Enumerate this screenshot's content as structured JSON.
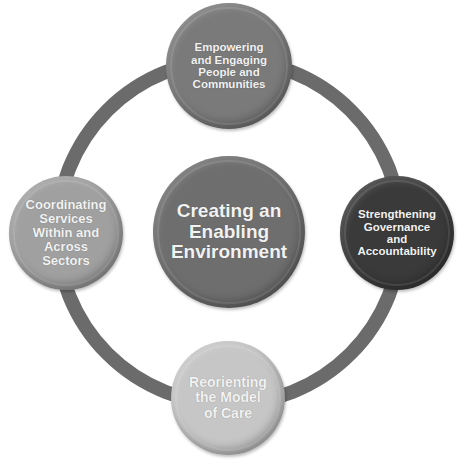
{
  "diagram": {
    "ring": {
      "color": "#6b6b6b",
      "cx": 229,
      "cy": 232,
      "r": 172,
      "stroke": 14
    },
    "center": {
      "label": "Creating an\nEnabling\nEnvironment",
      "color": "#6e6e6e",
      "cx": 229,
      "cy": 232,
      "r": 76,
      "font_size": 19
    },
    "nodes": [
      {
        "id": "top",
        "label": "Empowering\nand Engaging\nPeople and\nCommunities",
        "color": "#7a7a7a",
        "cx": 229,
        "cy": 66,
        "r": 63,
        "font_size": 11.5
      },
      {
        "id": "right",
        "label": "Strengthening\nGovernance\nand\nAccountability",
        "color": "#3a3a3a",
        "cx": 397,
        "cy": 233,
        "r": 57,
        "font_size": 11.5
      },
      {
        "id": "bottom",
        "label": "Reorienting\nthe Model\nof Care",
        "color": "#c6c6c6",
        "cx": 228,
        "cy": 398,
        "r": 57,
        "font_size": 14
      },
      {
        "id": "left",
        "label": "Coordinating\nServices\nWithin and\nAcross\nSectors",
        "color": "#a0a0a0",
        "cx": 66,
        "cy": 233,
        "r": 57,
        "font_size": 13
      }
    ]
  }
}
